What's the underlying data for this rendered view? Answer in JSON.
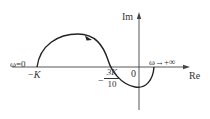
{
  "diagram": {
    "type": "nyquist-plot",
    "axes": {
      "real_label": "Re",
      "imag_label": "Im",
      "origin_label": "0"
    },
    "points": {
      "start_label": "ω=0",
      "end_label": "ω→+∞",
      "minus_k_sign": "−",
      "minus_k_var": "K",
      "crossing_sign": "−",
      "crossing_num": "3K",
      "crossing_den": "10"
    },
    "colors": {
      "curve": "#222222",
      "axis": "#333333"
    }
  }
}
